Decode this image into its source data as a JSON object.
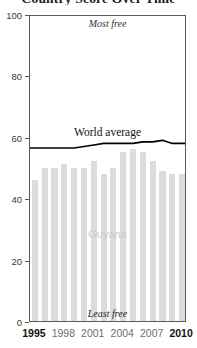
{
  "chart_data": {
    "type": "bar",
    "title": "Country Score Over Time",
    "subtitle": "",
    "xlabel": "",
    "ylabel": "",
    "ylim": [
      0,
      100
    ],
    "xlim": [
      1995,
      2010
    ],
    "grid": false,
    "legend_position": "inline-annotation",
    "y_ticks": [
      0,
      20,
      40,
      60,
      80,
      100
    ],
    "x_ticks": [
      1995,
      1998,
      2001,
      2004,
      2007,
      2010
    ],
    "categories": [
      1995,
      1996,
      1997,
      1998,
      1999,
      2000,
      2001,
      2002,
      2003,
      2004,
      2005,
      2006,
      2007,
      2008,
      2009,
      2010
    ],
    "series": [
      {
        "name": "Guyana",
        "kind": "bar",
        "color": "#dcdcdc",
        "values": [
          46,
          50,
          50,
          51,
          50,
          50,
          52,
          48,
          50,
          55,
          56,
          55,
          52,
          49,
          48,
          48
        ]
      },
      {
        "name": "World average",
        "kind": "line",
        "color": "#000000",
        "values": [
          57,
          57,
          57,
          57,
          57,
          57.5,
          58,
          58.5,
          58.5,
          58.5,
          58.5,
          59,
          59,
          59.5,
          58.5,
          58.5
        ]
      }
    ],
    "annotations": [
      {
        "name": "most-free",
        "text": "Most free",
        "position": "top-center"
      },
      {
        "name": "least-free",
        "text": "Least free",
        "position": "bottom-center"
      },
      {
        "name": "country-series",
        "text": "Guyana",
        "position": "middle-center"
      },
      {
        "name": "world-series",
        "text": "World average",
        "position": "upper-center"
      }
    ]
  },
  "labels": {
    "title": "Country Score Over Time",
    "most_free": "Most free",
    "least_free": "Least free",
    "country": "Guyana",
    "world_average": "World average"
  },
  "axis": {
    "y": {
      "ticks": [
        "0",
        "20",
        "40",
        "60",
        "80",
        "100"
      ]
    },
    "x": {
      "ticks": [
        "1995",
        "1998",
        "2001",
        "2004",
        "2007",
        "2010"
      ]
    }
  },
  "colors": {
    "bar": "#dcdcdc",
    "line": "#000000",
    "frame": "#58595b",
    "country_label": "#c9c9c9",
    "tick_text": "#6d6e71",
    "endpoint_tick_text": "#111111"
  }
}
